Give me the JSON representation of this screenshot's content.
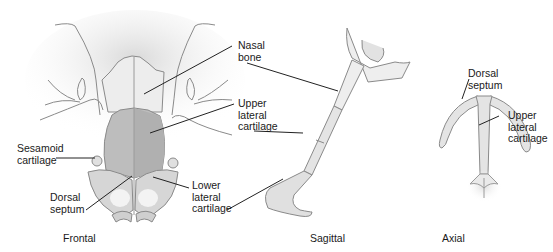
{
  "figure": {
    "views": [
      {
        "id": "frontal",
        "caption": "Frontal"
      },
      {
        "id": "sagittal",
        "caption": "Sagittal"
      },
      {
        "id": "axial",
        "caption": "Axial"
      }
    ],
    "labels": {
      "nasal_bone": "Nasal\nbone",
      "upper_lateral_cartilage": "Upper\nlateral\ncartilage",
      "sesamoid_cartilage": "Sesamoid\ncartilage",
      "dorsal_septum_frontal": "Dorsal\nseptum",
      "lower_lateral_cartilage": "Lower\nlateral\ncartilage",
      "dorsal_septum_axial": "Dorsal\nseptum",
      "upper_lateral_cartilage_axial": "Upper\nlateral\ncartilage"
    },
    "colors": {
      "outline": "#8a8a8a",
      "bone_fill": "#ececec",
      "cartilage_fill": "#bdbdbd",
      "lower_cartilage_fill": "#d6d6d6",
      "leader_line": "#222222"
    }
  }
}
